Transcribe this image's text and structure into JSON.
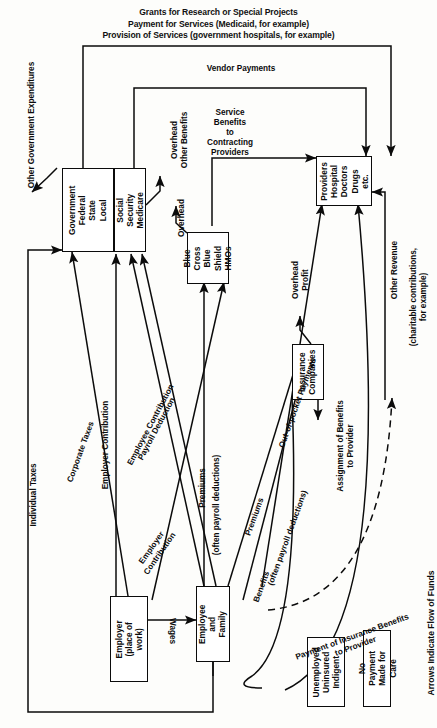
{
  "diagram": {
    "title_lines": [
      "Grants for Research or Special Projects",
      "Payment for Services (Medicaid, for example)",
      "Provision of Services (government hospitals, for example)"
    ],
    "footer_note": "Arrows Indicate Flow of Funds",
    "nodes": [
      {
        "id": "government",
        "label": "Government\nFederal\nState\nLocal"
      },
      {
        "id": "social_security",
        "label": "Social Security\nMedicare"
      },
      {
        "id": "blue_cross",
        "label": "Blue Cross\nBlue Shield\nHMOs"
      },
      {
        "id": "providers",
        "label": "Providers\nHospital\nDoctors\nDrugs\netc."
      },
      {
        "id": "insurance",
        "label": "Insurance\nCompanies"
      },
      {
        "id": "employer",
        "label": "Employer\n(place of work)"
      },
      {
        "id": "employee",
        "label": "Employee\nand\nFamily"
      },
      {
        "id": "unemployed",
        "label": "Unemployed\nUninsured\nIndigent"
      },
      {
        "id": "no_payment",
        "label": "No Payment\nMade for Care"
      }
    ],
    "edge_labels": [
      {
        "id": "other_gov_expenditures",
        "text": "Other Government Expenditures"
      },
      {
        "id": "vendor_payments",
        "text": "Vendor Payments"
      },
      {
        "id": "overhead_other_benefits",
        "text": "Overhead\nOther Benefits"
      },
      {
        "id": "service_benefits_to_contracting",
        "text": "Service\nBenefits\nto\nContracting\nProviders"
      },
      {
        "id": "overhead_blue_cross",
        "text": "Overhead"
      },
      {
        "id": "other_revenue",
        "text": "Other Revenue"
      },
      {
        "id": "other_revenue_paren",
        "text": "(charitable contributions,\nfor example)"
      },
      {
        "id": "overhead_profit",
        "text": "Overhead\nProfit"
      },
      {
        "id": "individual_taxes",
        "text": "Individual Taxes"
      },
      {
        "id": "corporate_taxes",
        "text": "Corporate Taxes"
      },
      {
        "id": "employer_contribution",
        "text": "Employer Contribution"
      },
      {
        "id": "employee_contribution",
        "text": "Employee Contribution"
      },
      {
        "id": "payroll_deduction",
        "text": "Payroll Deduction"
      },
      {
        "id": "premiums_blue_cross",
        "text": "Premiums"
      },
      {
        "id": "premiums_blue_cross_paren",
        "text": "(often payroll deductions)"
      },
      {
        "id": "employer_contribution_2",
        "text": "Employer\nContribution"
      },
      {
        "id": "out_of_pocket_payments",
        "text": "Out-of-pocket Payments"
      },
      {
        "id": "premiums_insurance",
        "text": "Premiums"
      },
      {
        "id": "premiums_insurance_paren",
        "text": "(often payroll deductions)"
      },
      {
        "id": "benefits",
        "text": "Benefits"
      },
      {
        "id": "assignment_of_benefits",
        "text": "Assignment of Benefits\nto Provider"
      },
      {
        "id": "payment_of_insurance_benefits",
        "text": "Payment of Insurance Benefits\nto Provider"
      },
      {
        "id": "wages",
        "text": "Wages"
      }
    ],
    "colors": {
      "ink": "#0b0b0b",
      "paper": "#fdfdfb"
    }
  }
}
